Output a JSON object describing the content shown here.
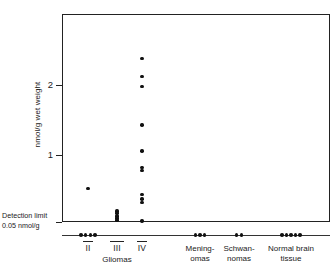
{
  "chart_data": {
    "type": "scatter",
    "title": "",
    "xlabel": "",
    "ylabel": "nmol/g wet weight",
    "ylim": [
      0,
      2.9
    ],
    "yticks": [
      1,
      2
    ],
    "ytick_labels": [
      "1",
      "2"
    ],
    "grid": false,
    "legend": false,
    "detection_limit": {
      "value": 0.05,
      "line1": "Detection limit",
      "line2": "0.05 nmol/g"
    },
    "group_header": "Gliomas",
    "categories": [
      {
        "label": "II",
        "roman": true,
        "group": "Gliomas",
        "values": [
          0.52
        ],
        "below_limit_count": 4
      },
      {
        "label": "III",
        "roman": true,
        "group": "Gliomas",
        "values": [
          0.2,
          0.17,
          0.13,
          0.1,
          0.07
        ],
        "below_limit_count": 0
      },
      {
        "label": "IV",
        "roman": true,
        "group": "Gliomas",
        "values": [
          2.38,
          2.12,
          1.98,
          1.43,
          1.06,
          0.82,
          0.78,
          0.44,
          0.37,
          0.32,
          0.06
        ],
        "below_limit_count": 0
      },
      {
        "label": "Mening-\nomas",
        "roman": false,
        "group": "",
        "values": [],
        "below_limit_count": 3
      },
      {
        "label": "Schwan-\nnomas",
        "roman": false,
        "group": "",
        "values": [],
        "below_limit_count": 2
      },
      {
        "label": "Normal brain\ntissue",
        "roman": false,
        "group": "",
        "values": [],
        "below_limit_count": 5
      }
    ],
    "marker_color": "#111111",
    "axis_color": "#222222"
  }
}
